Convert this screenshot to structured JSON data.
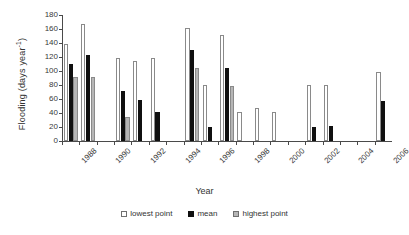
{
  "chart_data": {
    "type": "bar",
    "title": "",
    "xlabel": "Year",
    "ylabel": "Flooding (days year",
    "ylabel_sup": "-1",
    "ylabel_close": ")",
    "ylim": [
      0,
      180
    ],
    "ytick_step": 20,
    "yticks": [
      180,
      160,
      140,
      120,
      100,
      80,
      60,
      40,
      20,
      0
    ],
    "grid": false,
    "legend_position": "bottom",
    "categories": [
      "1988",
      "1989",
      "1990",
      "1991",
      "1992",
      "1993",
      "1994",
      "1995",
      "1996",
      "1997",
      "1998",
      "1999",
      "2000",
      "2001",
      "2002",
      "2003",
      "2004",
      "2005",
      "2006"
    ],
    "xtick_labels": [
      "1988",
      "1990",
      "1992",
      "1994",
      "1996",
      "1998",
      "2000",
      "2002",
      "2004",
      "2006"
    ],
    "series": [
      {
        "name": "lowest point",
        "color": "#ffffff",
        "values": [
          138,
          167,
          null,
          118,
          115,
          118,
          null,
          162,
          80,
          152,
          42,
          47,
          42,
          null,
          80,
          80,
          null,
          null,
          98
        ]
      },
      {
        "name": "mean",
        "color": "#101010",
        "values": [
          110,
          123,
          null,
          72,
          58,
          42,
          null,
          130,
          20,
          105,
          null,
          null,
          null,
          null,
          20,
          22,
          null,
          null,
          57
        ]
      },
      {
        "name": "highest point",
        "color": "#b6b6b6",
        "values": [
          92,
          92,
          null,
          35,
          null,
          null,
          null,
          105,
          null,
          78,
          null,
          null,
          null,
          null,
          null,
          null,
          null,
          null,
          null
        ]
      }
    ]
  }
}
